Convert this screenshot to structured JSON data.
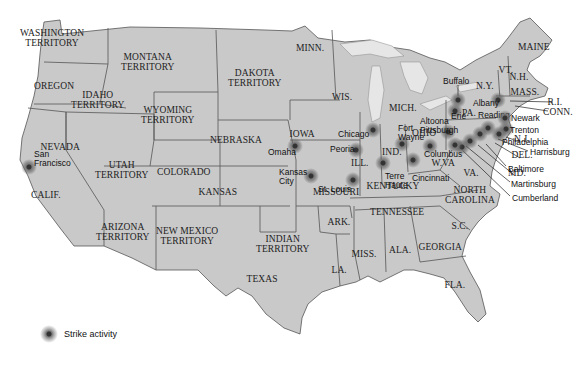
{
  "map": {
    "states": [
      {
        "label": "WASHINGTON\nTERRITORY",
        "x": 52,
        "y": 38
      },
      {
        "label": "MONTANA\nTERRITORY",
        "x": 148,
        "y": 62
      },
      {
        "label": "DAKOTA\nTERRITORY",
        "x": 255,
        "y": 78
      },
      {
        "label": "MINN.",
        "x": 310,
        "y": 48
      },
      {
        "label": "OREGON",
        "x": 54,
        "y": 86
      },
      {
        "label": "IDAHO\nTERRITORY",
        "x": 98,
        "y": 100
      },
      {
        "label": "WYOMING\nTERRITORY",
        "x": 168,
        "y": 115
      },
      {
        "label": "WIS.",
        "x": 342,
        "y": 97
      },
      {
        "label": "MICH.",
        "x": 403,
        "y": 108
      },
      {
        "label": "IOWA",
        "x": 302,
        "y": 134
      },
      {
        "label": "NEBRASKA",
        "x": 236,
        "y": 140
      },
      {
        "label": "NEVADA",
        "x": 60,
        "y": 147
      },
      {
        "label": "UTAH\nTERRITORY",
        "x": 122,
        "y": 170
      },
      {
        "label": "COLORADO",
        "x": 184,
        "y": 172
      },
      {
        "label": "ILL.",
        "x": 360,
        "y": 163
      },
      {
        "label": "IND.",
        "x": 392,
        "y": 152
      },
      {
        "label": "OHIO",
        "x": 424,
        "y": 133
      },
      {
        "label": "W.VA",
        "x": 443,
        "y": 163
      },
      {
        "label": "VA.",
        "x": 471,
        "y": 173
      },
      {
        "label": "KANSAS",
        "x": 218,
        "y": 192
      },
      {
        "label": "MISSOURI",
        "x": 336,
        "y": 192
      },
      {
        "label": "KENTUCKY",
        "x": 393,
        "y": 186
      },
      {
        "label": "CALIF.",
        "x": 46,
        "y": 195
      },
      {
        "label": "NORTH\nCAROLINA",
        "x": 470,
        "y": 195
      },
      {
        "label": "TENNESSEE",
        "x": 397,
        "y": 212
      },
      {
        "label": "ARIZONA\nTERRITORY",
        "x": 123,
        "y": 232
      },
      {
        "label": "NEW MEXICO\nTERRITORY",
        "x": 187,
        "y": 236
      },
      {
        "label": "INDIAN\nTERRITORY",
        "x": 283,
        "y": 244
      },
      {
        "label": "ARK.",
        "x": 339,
        "y": 222
      },
      {
        "label": "S.C.",
        "x": 460,
        "y": 226
      },
      {
        "label": "GEORGIA",
        "x": 440,
        "y": 247
      },
      {
        "label": "MISS.",
        "x": 364,
        "y": 254
      },
      {
        "label": "ALA.",
        "x": 400,
        "y": 250
      },
      {
        "label": "LA.",
        "x": 339,
        "y": 270
      },
      {
        "label": "TEXAS",
        "x": 262,
        "y": 279
      },
      {
        "label": "FLA.",
        "x": 455,
        "y": 285
      },
      {
        "label": "MAINE",
        "x": 534,
        "y": 47
      },
      {
        "label": "VT.",
        "x": 506,
        "y": 70
      },
      {
        "label": "N.H.",
        "x": 519,
        "y": 77
      },
      {
        "label": "N.Y.",
        "x": 485,
        "y": 86
      },
      {
        "label": "MASS.",
        "x": 525,
        "y": 92
      },
      {
        "label": "PA.",
        "x": 469,
        "y": 113
      },
      {
        "label": "R.I.",
        "x": 555,
        "y": 102
      },
      {
        "label": "CONN.",
        "x": 558,
        "y": 112
      },
      {
        "label": "N.J.",
        "x": 522,
        "y": 139
      },
      {
        "label": "DEL.",
        "x": 522,
        "y": 155
      },
      {
        "label": "MD.",
        "x": 517,
        "y": 173
      }
    ],
    "cities": [
      {
        "label": "San\nFrancisco",
        "x": 34,
        "y": 150,
        "sx": 29,
        "sy": 167
      },
      {
        "label": "Omaha",
        "x": 268,
        "y": 148,
        "sx": 295,
        "sy": 146
      },
      {
        "label": "Kansas\nCity",
        "x": 279,
        "y": 168,
        "sx": 311,
        "sy": 176
      },
      {
        "label": "St. Louis",
        "x": 318,
        "y": 185,
        "sx": 353,
        "sy": 180
      },
      {
        "label": "Peoria",
        "x": 330,
        "y": 145,
        "sx": 356,
        "sy": 150
      },
      {
        "label": "Chicago",
        "x": 338,
        "y": 130,
        "sx": 373,
        "sy": 130
      },
      {
        "label": "Fort\nWayne",
        "x": 398,
        "y": 124,
        "sx": 402,
        "sy": 144
      },
      {
        "label": "Terre\nHaute",
        "x": 385,
        "y": 172,
        "sx": 383,
        "sy": 163
      },
      {
        "label": "Cincinnati",
        "x": 412,
        "y": 174,
        "sx": 413,
        "sy": 160
      },
      {
        "label": "Columbus",
        "x": 424,
        "y": 150,
        "sx": 430,
        "sy": 146
      },
      {
        "label": "Altoona\nPittsburgh",
        "x": 420,
        "y": 117,
        "sx": 448,
        "sy": 132
      },
      {
        "label": "Buffalo",
        "x": 443,
        "y": 77,
        "sx": 458,
        "sy": 100
      },
      {
        "label": "Erie",
        "x": 451,
        "y": 112,
        "sx": 455,
        "sy": 111
      },
      {
        "label": "Albany",
        "x": 473,
        "y": 99,
        "sx": 498,
        "sy": 100
      },
      {
        "label": "Reading",
        "x": 478,
        "y": 111,
        "sx": 488,
        "sy": 128
      },
      {
        "label": "Newark",
        "x": 511,
        "y": 114,
        "sx": 505,
        "sy": 118
      },
      {
        "label": "Trenton",
        "x": 510,
        "y": 126,
        "sx": 506,
        "sy": 129
      },
      {
        "label": "Philadelphia",
        "x": 502,
        "y": 138,
        "sx": 499,
        "sy": 134
      },
      {
        "label": "Harrisburg",
        "x": 530,
        "y": 148,
        "sx": 480,
        "sy": 134
      },
      {
        "label": "Baltimore",
        "x": 508,
        "y": 165,
        "sx": 470,
        "sy": 141
      },
      {
        "label": "Martinsburg",
        "x": 511,
        "y": 180,
        "sx": 462,
        "sy": 147
      },
      {
        "label": "Cumberland",
        "x": 512,
        "y": 194,
        "sx": 455,
        "sy": 145
      }
    ]
  },
  "legend": {
    "label": "Strike activity",
    "icon": "strike-activity-icon"
  },
  "colors": {
    "land": "#c9c9c9",
    "border": "#555555",
    "water": "#ffffff",
    "strike": "#333333"
  }
}
